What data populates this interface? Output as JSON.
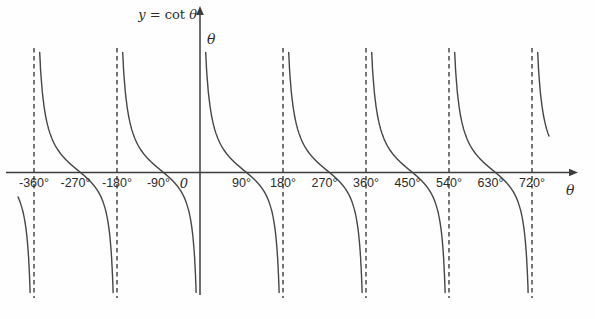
{
  "figure": {
    "kind": "trigonometric-function-graph",
    "background": "#fefefe"
  },
  "chart_data": {
    "type": "line",
    "title": "y = cot θ",
    "title_parts": {
      "y": "y",
      "eq": " = cot ",
      "theta": "θ"
    },
    "function": "cot(θ)",
    "period_deg": 180,
    "grid": "off",
    "legend": "none",
    "x_axis": {
      "label": "θ",
      "unit": "degrees",
      "tick_values_deg": [
        -360,
        -270,
        -180,
        -90,
        0,
        90,
        180,
        270,
        360,
        450,
        540,
        630,
        720
      ],
      "tick_labels": [
        "-360°",
        "-270°",
        "-180°",
        "-90°",
        "0",
        "90°",
        "180°",
        "270°",
        "360°",
        "450°",
        "540°",
        "630°",
        "720°"
      ],
      "visible_range_deg": [
        -436,
        818
      ]
    },
    "y_axis": {
      "label": "θ",
      "tick_labels": [],
      "visible_range_units": [
        -5.6,
        5.6
      ]
    },
    "asymptotes_deg": [
      -540,
      -360,
      -180,
      0,
      180,
      360,
      540,
      720
    ],
    "dashed_asymptote_lines_deg": [
      -360,
      -180,
      180,
      360,
      540,
      720
    ],
    "zeros_deg": [
      -450,
      -270,
      -90,
      90,
      270,
      450,
      630
    ],
    "styles": {
      "curve_color": "#474747",
      "axis_color": "#3d3d3d",
      "dash_color": "#2e2e2e",
      "label_color": "#2b2b2b"
    },
    "layout": {
      "width": 595,
      "height": 319,
      "origin_px": {
        "x": 200,
        "y": 172.5
      },
      "px_per_180deg": 83,
      "px_per_unit_y": 22,
      "curve_clip": {
        "x_min": 18,
        "x_max": 549,
        "y_min": 50,
        "y_max": 293
      },
      "curve_mid_skew_px": 5,
      "asymptote_line": {
        "y_top": 48,
        "y_bottom": 298
      },
      "x_axis_px": {
        "x_start": 6,
        "x_tip": 578
      },
      "y_axis_px": {
        "y_tip": 6,
        "y_bottom": 295
      },
      "tick_label_baseline_y": 187,
      "zero_label_x": 184
    }
  }
}
